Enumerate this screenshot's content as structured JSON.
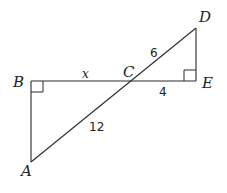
{
  "diagram": {
    "type": "geometry",
    "points": {
      "A": {
        "label": "A"
      },
      "B": {
        "label": "B"
      },
      "C": {
        "label": "C"
      },
      "D": {
        "label": "D"
      },
      "E": {
        "label": "E"
      }
    },
    "segments": {
      "BC": {
        "label": "x"
      },
      "CD": {
        "label": "6"
      },
      "CE": {
        "label": "4"
      },
      "AC": {
        "label": "12"
      }
    },
    "right_angles": [
      "B",
      "E"
    ]
  }
}
